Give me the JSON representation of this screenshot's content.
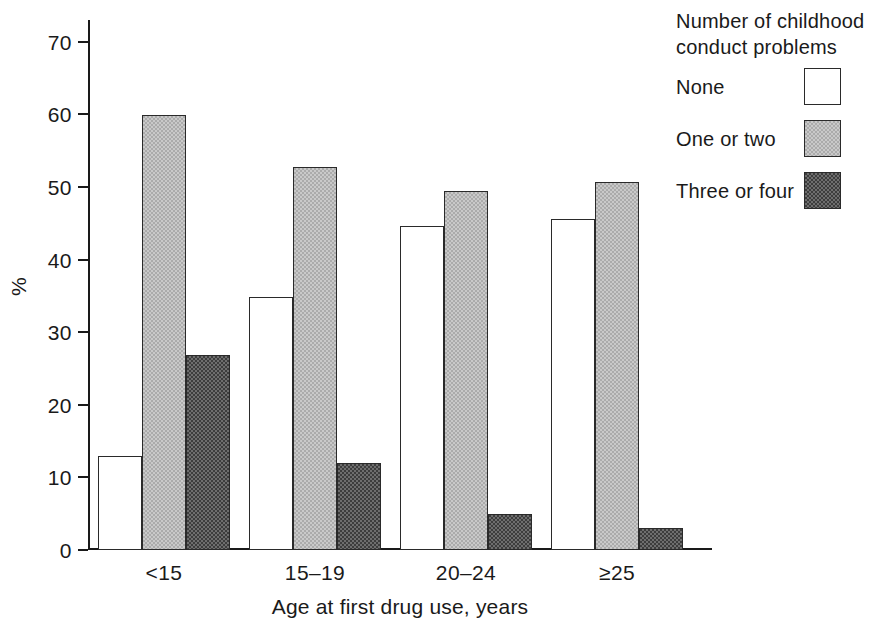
{
  "chart_data": {
    "type": "bar",
    "title": "",
    "subtitle": "",
    "xlabel": "Age at first drug use, years",
    "ylabel": "%",
    "categories": [
      "<15",
      "15–19",
      "20–24",
      "≥25"
    ],
    "series": [
      {
        "name": "None",
        "values": [
          13.0,
          34.9,
          44.6,
          45.6
        ],
        "color": "#ffffff"
      },
      {
        "name": "One or two",
        "values": [
          59.9,
          52.8,
          49.4,
          50.7
        ],
        "color": "#ababab"
      },
      {
        "name": "Three or four",
        "values": [
          26.9,
          12.0,
          5.0,
          3.0
        ],
        "color": "#3d3d3d"
      }
    ],
    "ylim": [
      0,
      73
    ],
    "yticks": [
      0,
      10,
      20,
      30,
      40,
      50,
      60,
      70
    ],
    "ytick_labels": [
      "0",
      "10",
      "20",
      "30",
      "40",
      "50",
      "60",
      "70"
    ],
    "grid": false,
    "legend_position": "top-right"
  },
  "legend": {
    "title_line1": "Number of childhood",
    "title_line2": "conduct problems",
    "entries": [
      {
        "label": "None",
        "swatch": "white-square"
      },
      {
        "label": "One or two",
        "swatch": "light-gray-square"
      },
      {
        "label": "Three or four",
        "swatch": "dark-gray-square"
      }
    ]
  },
  "axes": {
    "y_title": "%",
    "x_title": "Age at first drug use, years"
  },
  "colors": {
    "none_fill": "#ffffff",
    "one_or_two_fill": "#ababab",
    "three_or_four_fill": "#3d3d3d",
    "axis": "#1a1a1a",
    "background": "#ffffff"
  }
}
